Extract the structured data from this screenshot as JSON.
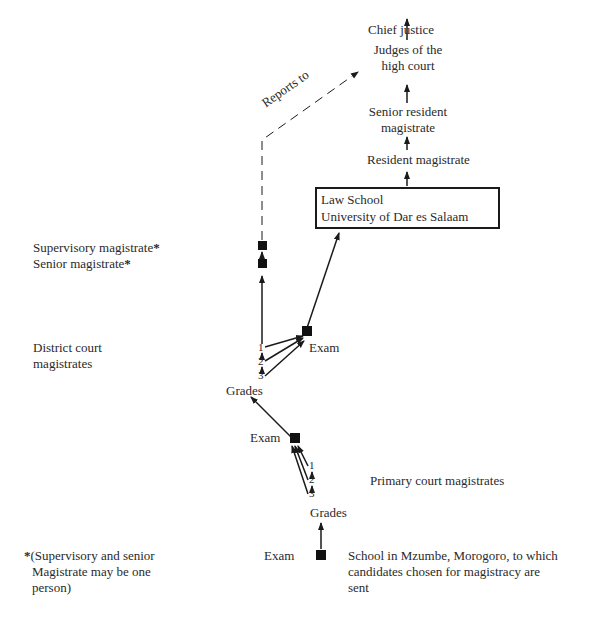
{
  "ladder": {
    "chief_justice": "Chief justice",
    "judges_line1": "Judges of the",
    "judges_line2": "high court",
    "senior_resident_line1": "Senior resident",
    "senior_resident_line2": "magistrate",
    "resident_magistrate": "Resident magistrate",
    "law_school_line1": "Law School",
    "law_school_line2": "University of Dar es Salaam"
  },
  "reports_to": "Reports to",
  "left_labels": {
    "supervisory": "Supervisory magistrate",
    "senior": "Senior magistrate",
    "asterisk": "*",
    "district_line1": "District court",
    "district_line2": "magistrates",
    "footnote_line1": "(Supervisory and senior",
    "footnote_line2": "Magistrate may be one",
    "footnote_line3": "person)"
  },
  "district": {
    "exam": "Exam",
    "grades": [
      "1",
      "2",
      "3"
    ],
    "grades_label": "Grades"
  },
  "primary": {
    "exam": "Exam",
    "grades": [
      "1",
      "2",
      "3"
    ],
    "grades_label": "Grades",
    "label": "Primary court magistrates"
  },
  "school": {
    "exam": "Exam",
    "line1": "School in Mzumbe, Morogoro, to which",
    "line2": "candidates chosen for magistracy are",
    "line3": "sent"
  }
}
